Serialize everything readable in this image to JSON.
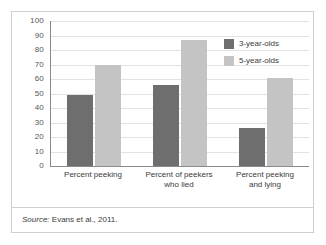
{
  "chart_data": {
    "type": "bar",
    "title": "",
    "xlabel": "",
    "ylabel": "",
    "ylim": [
      0,
      100
    ],
    "yticks": [
      0,
      10,
      20,
      30,
      40,
      50,
      60,
      70,
      80,
      90,
      100
    ],
    "grid": true,
    "legend_position": "top-right",
    "categories": [
      "Percent peeking",
      "Percent of peekers who lied",
      "Percent peeking and lying"
    ],
    "category_lines": [
      [
        "Percent peeking"
      ],
      [
        "Percent of peekers",
        "who lied"
      ],
      [
        "Percent peeking",
        "and lying"
      ]
    ],
    "series": [
      {
        "name": "3-year-olds",
        "color": "#6e6e6e",
        "values": [
          49,
          56,
          26
        ]
      },
      {
        "name": "5-year-olds",
        "color": "#c4c4c4",
        "values": [
          70,
          87,
          61
        ]
      }
    ]
  },
  "source": {
    "prefix": "Source:",
    "text": "Evans et al., 2011."
  },
  "colors": {
    "series_3yo": "#6e6e6e",
    "series_5yo": "#c4c4c4",
    "gridline": "#e2e2e2",
    "axis": "#8a8a8a",
    "frame": "#cfcfcf",
    "text": "#3a3a3a"
  }
}
